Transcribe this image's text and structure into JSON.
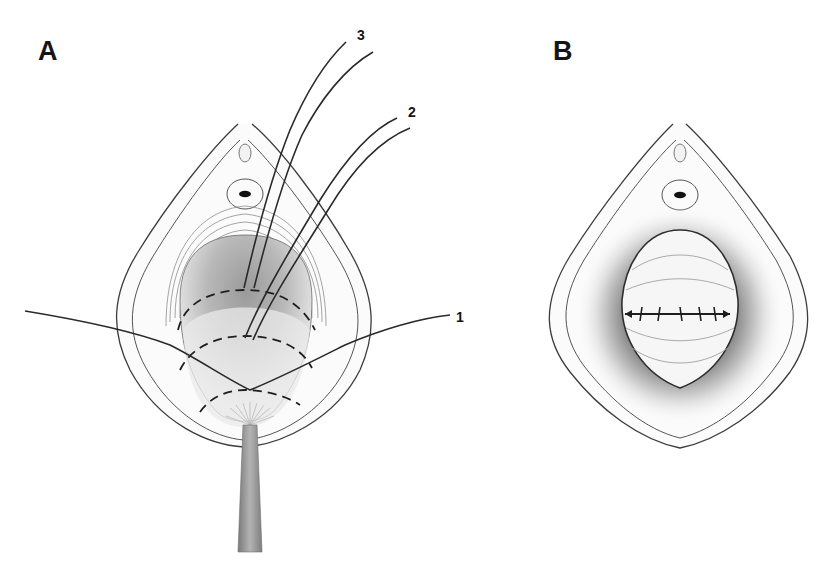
{
  "figure": {
    "panels": [
      {
        "id": "A",
        "label": "A",
        "suture_labels": [
          {
            "id": "1",
            "text": "1"
          },
          {
            "id": "2",
            "text": "2"
          },
          {
            "id": "3",
            "text": "3"
          }
        ]
      },
      {
        "id": "B",
        "label": "B"
      }
    ],
    "colors": {
      "line": "#3a3a3a",
      "suture": "#222222",
      "shadow": "#8a8a8a",
      "instrument": "#9a9a9a",
      "background": "#ffffff"
    }
  }
}
